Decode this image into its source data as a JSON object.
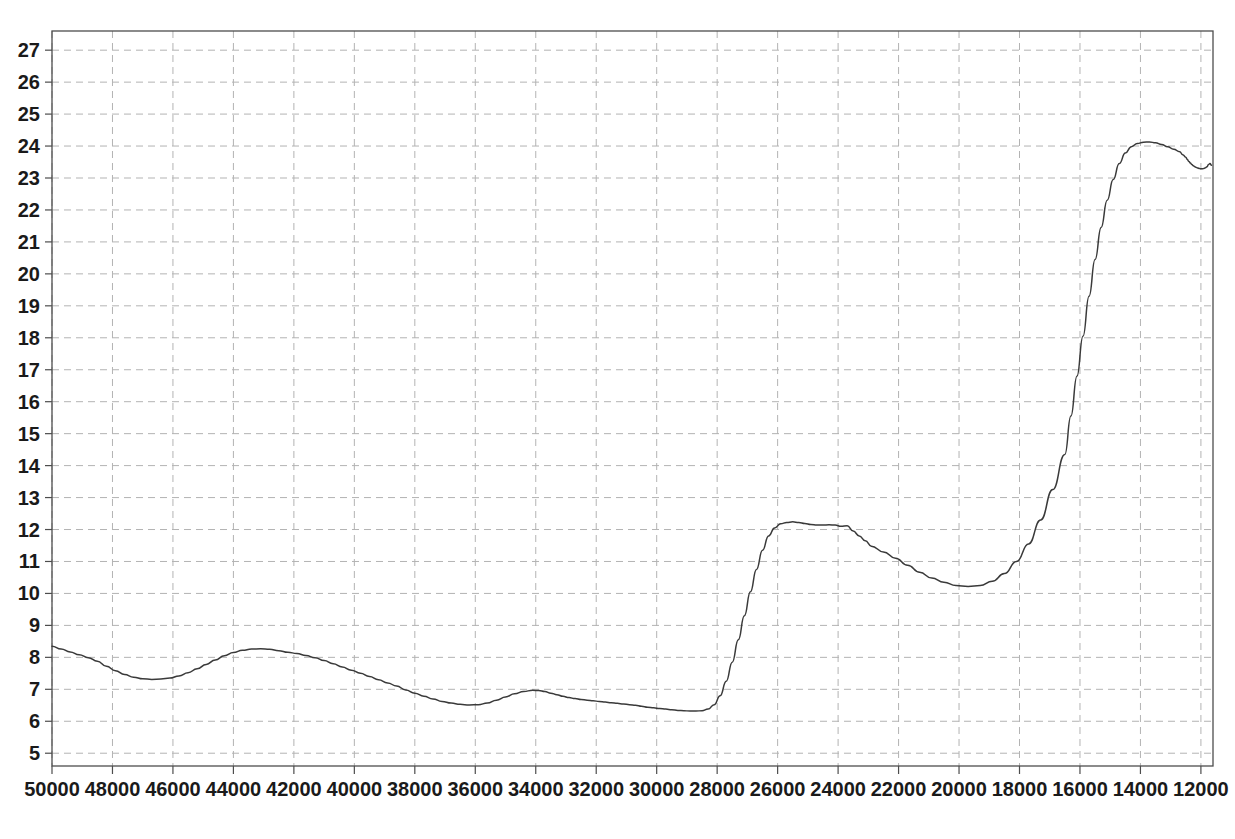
{
  "figure": {
    "name": "spectrum-plot",
    "background_color": "#ffffff",
    "frame_color": "#4d4d4d",
    "grid_color": "#b0b0b0",
    "line_color": "#3a3a3a",
    "caption": ""
  },
  "chart_data": {
    "type": "line",
    "title": "",
    "xlabel": "",
    "ylabel": "",
    "xlim": [
      50000,
      11600
    ],
    "ylim": [
      4.6,
      27.6
    ],
    "x_inverted": true,
    "grid": true,
    "legend": "none",
    "xticks": [
      50000,
      48000,
      46000,
      44000,
      42000,
      40000,
      38000,
      36000,
      34000,
      32000,
      30000,
      28000,
      26000,
      24000,
      22000,
      20000,
      18000,
      16000,
      14000,
      12000
    ],
    "xtick_labels": [
      "50000",
      "48000",
      "46000",
      "44000",
      "42000",
      "40000",
      "38000",
      "36000",
      "34000",
      "32000",
      "30000",
      "28000",
      "26000",
      "24000",
      "22000",
      "20000",
      "18000",
      "16000",
      "14000",
      "12000"
    ],
    "yticks": [
      5,
      6,
      7,
      8,
      9,
      10,
      11,
      12,
      13,
      14,
      15,
      16,
      17,
      18,
      19,
      20,
      21,
      22,
      23,
      24,
      25,
      26,
      27
    ],
    "ytick_labels": [
      "5",
      "6",
      "7",
      "8",
      "9",
      "10",
      "11",
      "12",
      "13",
      "14",
      "15",
      "16",
      "17",
      "18",
      "19",
      "20",
      "21",
      "22",
      "23",
      "24",
      "25",
      "26",
      "27"
    ],
    "series": [
      {
        "name": "spectrum",
        "x": [
          50000,
          49700,
          49400,
          49100,
          48800,
          48500,
          48200,
          47900,
          47600,
          47300,
          47000,
          46700,
          46400,
          46100,
          45800,
          45500,
          45200,
          44900,
          44600,
          44300,
          44000,
          43700,
          43400,
          43100,
          42800,
          42500,
          42200,
          41900,
          41600,
          41300,
          41000,
          40700,
          40400,
          40100,
          39800,
          39500,
          39200,
          38900,
          38600,
          38300,
          38000,
          37700,
          37400,
          37100,
          36800,
          36500,
          36200,
          35900,
          35600,
          35300,
          35000,
          34700,
          34400,
          34100,
          33900,
          33700,
          33500,
          33300,
          33100,
          32900,
          32700,
          32500,
          32300,
          32100,
          31900,
          31700,
          31500,
          31300,
          31100,
          30900,
          30700,
          30500,
          30300,
          30100,
          29900,
          29700,
          29500,
          29300,
          29100,
          28900,
          28700,
          28500,
          28300,
          28100,
          27900,
          27700,
          27500,
          27300,
          27100,
          26900,
          26700,
          26500,
          26300,
          26100,
          25900,
          25700,
          25500,
          25300,
          25100,
          24900,
          24700,
          24500,
          24300,
          24100,
          23900,
          23700,
          23500,
          23300,
          23100,
          22900,
          22500,
          22100,
          21700,
          21300,
          20900,
          20500,
          20100,
          19700,
          19300,
          18900,
          18500,
          18100,
          17700,
          17300,
          16900,
          16500,
          16300,
          16100,
          15900,
          15700,
          15500,
          15300,
          15100,
          14900,
          14700,
          14500,
          14300,
          14100,
          13900,
          13700,
          13500,
          13300,
          13100,
          12900,
          12700,
          12600,
          12500,
          12450,
          12400,
          12350,
          12300,
          12250,
          12200,
          12150,
          12100,
          12050,
          12000,
          11950,
          11900,
          11850,
          11800,
          11750,
          11700,
          11650
        ],
        "y": [
          8.35,
          8.26,
          8.17,
          8.08,
          7.99,
          7.88,
          7.72,
          7.58,
          7.46,
          7.38,
          7.33,
          7.31,
          7.32,
          7.35,
          7.42,
          7.52,
          7.64,
          7.78,
          7.92,
          8.05,
          8.15,
          8.22,
          8.26,
          8.27,
          8.25,
          8.21,
          8.16,
          8.12,
          8.06,
          7.99,
          7.9,
          7.8,
          7.7,
          7.6,
          7.5,
          7.4,
          7.3,
          7.2,
          7.1,
          6.98,
          6.88,
          6.78,
          6.7,
          6.62,
          6.57,
          6.53,
          6.51,
          6.52,
          6.57,
          6.66,
          6.76,
          6.86,
          6.93,
          6.97,
          6.96,
          6.93,
          6.88,
          6.83,
          6.78,
          6.74,
          6.71,
          6.68,
          6.66,
          6.64,
          6.62,
          6.6,
          6.58,
          6.56,
          6.54,
          6.52,
          6.5,
          6.47,
          6.44,
          6.42,
          6.4,
          6.38,
          6.36,
          6.34,
          6.33,
          6.32,
          6.32,
          6.33,
          6.38,
          6.52,
          6.8,
          7.25,
          7.85,
          8.55,
          9.3,
          10.05,
          10.75,
          11.35,
          11.8,
          12.05,
          12.18,
          12.22,
          12.24,
          12.22,
          12.19,
          12.16,
          12.14,
          12.14,
          12.15,
          12.14,
          12.1,
          12.12,
          11.95,
          11.8,
          11.65,
          11.48,
          11.3,
          11.1,
          10.88,
          10.66,
          10.48,
          10.35,
          10.25,
          10.22,
          10.25,
          10.38,
          10.62,
          11.0,
          11.55,
          12.3,
          13.25,
          14.35,
          15.55,
          16.8,
          18.05,
          19.3,
          20.45,
          21.45,
          22.3,
          22.95,
          23.45,
          23.78,
          23.98,
          24.08,
          24.12,
          24.13,
          24.1,
          24.05,
          23.98,
          23.9,
          23.82,
          23.73,
          23.65,
          23.58,
          23.52,
          23.47,
          23.42,
          23.38,
          23.35,
          23.33,
          23.31,
          23.3,
          23.29,
          23.29,
          23.3,
          23.32,
          23.35,
          23.42,
          23.45,
          23.4
        ]
      }
    ],
    "features": {
      "left_start_value": 8.35,
      "first_minimum": {
        "x": 46500,
        "y": 7.31
      },
      "first_maximum": {
        "x": 44900,
        "y": 8.27
      },
      "broad_minimum": {
        "x": 36300,
        "y": 6.51
      },
      "small_bump": {
        "x": 38900,
        "y": 6.97
      },
      "baseline_low": {
        "x": 34200,
        "y": 6.32
      },
      "mid_plateau": {
        "x": 30900,
        "y": 12.24
      },
      "deep_minimum": {
        "x": 28400,
        "y": 10.22
      },
      "main_plateau": {
        "x": 23200,
        "y": 24.13
      },
      "shoulder_plateau": {
        "x": 18000,
        "y": 23.3
      },
      "right_maximum": {
        "x": 12600,
        "y": 25.88
      },
      "terminal_spike_low": {
        "x": 12230,
        "y": 23.05
      },
      "terminal_spike_high": {
        "x": 12100,
        "y": 24.6
      },
      "end_value": 24.1
    }
  },
  "axes": {
    "ytick_labels": [
      "27",
      "26",
      "25",
      "24",
      "23",
      "22",
      "21",
      "20",
      "19",
      "18",
      "17",
      "16",
      "15",
      "14",
      "13",
      "12",
      "11",
      "10",
      "9",
      "8",
      "7",
      "6",
      "5"
    ],
    "xtick_labels": [
      "50000",
      "48000",
      "46000",
      "44000",
      "42000",
      "40000",
      "38000",
      "36000",
      "34000",
      "32000",
      "30000",
      "28000",
      "26000",
      "24000",
      "22000",
      "20000",
      "18000",
      "16000",
      "14000",
      "12000"
    ]
  }
}
